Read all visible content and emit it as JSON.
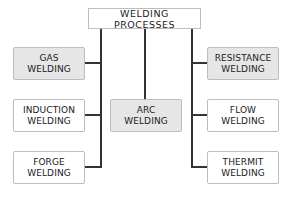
{
  "diagram": {
    "root": {
      "label": "WELDING PROCESSES"
    },
    "nodes": [
      {
        "id": "gas",
        "line1": "GAS",
        "line2": "WELDING",
        "shaded": true,
        "column": "left"
      },
      {
        "id": "induction",
        "line1": "INDUCTION",
        "line2": "WELDING",
        "shaded": false,
        "column": "left"
      },
      {
        "id": "forge",
        "line1": "FORGE",
        "line2": "WELDING",
        "shaded": false,
        "column": "left"
      },
      {
        "id": "arc",
        "line1": "ARC",
        "line2": "WELDING",
        "shaded": true,
        "column": "center"
      },
      {
        "id": "resistance",
        "line1": "RESISTANCE",
        "line2": "WELDING",
        "shaded": true,
        "column": "right"
      },
      {
        "id": "flow",
        "line1": "FLOW",
        "line2": "WELDING",
        "shaded": false,
        "column": "right"
      },
      {
        "id": "thermit",
        "line1": "THERMIT",
        "line2": "WELDING",
        "shaded": false,
        "column": "right"
      }
    ],
    "colors": {
      "shaded_fill": "#e6e6e6",
      "plain_fill": "#ffffff",
      "border": "#bdbdbd",
      "connector": "#333333"
    }
  }
}
